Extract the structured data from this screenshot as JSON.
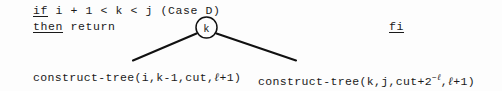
{
  "pseudocode": {
    "if_line": {
      "keyword": "if",
      "condition": " i + 1 < k < j (Case D)"
    },
    "then_line": {
      "keyword": "then",
      "statement": " return"
    },
    "fi_line": {
      "keyword": "fi"
    }
  },
  "tree": {
    "root_node_label": "k",
    "left_edge": "branch-left",
    "right_edge": "branch-right",
    "node_shape": "circle"
  },
  "leaves": {
    "left": {
      "name": "construct-tree",
      "open": "(",
      "args_before_ell": "i,k-1,cut,",
      "ell": "ℓ",
      "args_after_ell": "+1",
      "close": ")",
      "full_text": "construct-tree(i,k-1,cut,ℓ+1)"
    },
    "right": {
      "name": "construct-tree",
      "open": "(",
      "args_before_pow": "k,j,cut+2",
      "exponent_sign": "−",
      "exponent_ell": "ℓ",
      "args_after_pow": ",",
      "ell": "ℓ",
      "args_tail": "+1",
      "close": ")",
      "full_text": "construct-tree(k,j,cut+2^{-ℓ},ℓ+1)"
    }
  },
  "colors": {
    "background": "#fdfdfd",
    "ink": "#1a1a1a",
    "stroke": "#111111"
  }
}
